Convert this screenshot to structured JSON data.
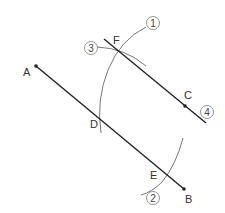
{
  "diagram": {
    "colors": {
      "line": "#222222",
      "arc": "#777777",
      "circle": "#888888",
      "text": "#333333"
    },
    "points": {
      "A": {
        "label": "A",
        "x": 36,
        "y": 66
      },
      "B": {
        "label": "B",
        "x": 184,
        "y": 189
      },
      "C": {
        "label": "C",
        "x": 185,
        "y": 106
      },
      "D": {
        "label": "D",
        "x": 99,
        "y": 122
      },
      "E": {
        "label": "E",
        "x": 167,
        "y": 175
      },
      "F": {
        "label": "F",
        "x": 117,
        "y": 50
      }
    },
    "steps": [
      {
        "label": "1",
        "x": 153,
        "y": 23
      },
      {
        "label": "2",
        "x": 153,
        "y": 198
      },
      {
        "label": "3",
        "x": 91,
        "y": 48
      },
      {
        "label": "4",
        "x": 207,
        "y": 112
      }
    ]
  }
}
